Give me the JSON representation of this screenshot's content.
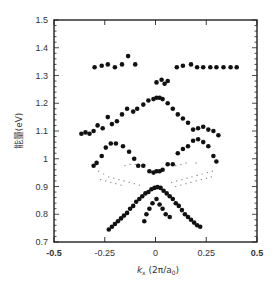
{
  "chart_data": {
    "type": "scatter",
    "title": "",
    "xlabel": "k_x (2π/a_0)",
    "xlabel_parts": {
      "main": "k",
      "sub": "x",
      "rest": " (2π/a",
      "sub2": "0",
      "end": ")"
    },
    "ylabel": "能量(eV)",
    "xlim": [
      -0.5,
      0.5
    ],
    "ylim": [
      0.7,
      1.5
    ],
    "xticks": [
      -0.5,
      -0.25,
      0,
      0.25,
      0.5
    ],
    "xtick_labels": [
      "-0.5",
      "-0.25",
      "0",
      "0.25",
      "0.5"
    ],
    "yticks": [
      0.7,
      0.8,
      0.9,
      1.0,
      1.1,
      1.2,
      1.3,
      1.4,
      1.5
    ],
    "ytick_labels": [
      "0.7",
      "0.8",
      "0.9",
      "1",
      "1.1",
      "1.2",
      "1.3",
      "1.4",
      "1.5"
    ],
    "grid": false,
    "legend": null,
    "series": [
      {
        "name": "upper-flat-band",
        "marker": "dot-large",
        "points": [
          [
            -0.3,
            1.33
          ],
          [
            -0.265,
            1.335
          ],
          [
            -0.235,
            1.34
          ],
          [
            -0.2,
            1.33
          ],
          [
            -0.165,
            1.34
          ],
          [
            -0.135,
            1.37
          ],
          [
            -0.1,
            1.34
          ],
          [
            0.105,
            1.33
          ],
          [
            0.135,
            1.335
          ],
          [
            0.175,
            1.34
          ],
          [
            0.205,
            1.33
          ],
          [
            0.235,
            1.33
          ],
          [
            0.27,
            1.33
          ],
          [
            0.3,
            1.33
          ],
          [
            0.335,
            1.33
          ],
          [
            0.37,
            1.33
          ],
          [
            0.4,
            1.33
          ]
        ]
      },
      {
        "name": "center-cluster-1.28",
        "marker": "dot-large",
        "points": [
          [
            0.005,
            1.275
          ],
          [
            0.03,
            1.285
          ],
          [
            0.045,
            1.27
          ],
          [
            0.06,
            1.28
          ]
        ]
      },
      {
        "name": "upper-A-band",
        "marker": "dot-large",
        "points": [
          [
            -0.365,
            1.09
          ],
          [
            -0.345,
            1.095
          ],
          [
            -0.325,
            1.09
          ],
          [
            -0.305,
            1.1
          ],
          [
            -0.285,
            1.12
          ],
          [
            -0.26,
            1.11
          ],
          [
            -0.235,
            1.15
          ],
          [
            -0.215,
            1.125
          ],
          [
            -0.19,
            1.135
          ],
          [
            -0.165,
            1.16
          ],
          [
            -0.14,
            1.18
          ],
          [
            -0.11,
            1.17
          ],
          [
            -0.09,
            1.18
          ],
          [
            -0.06,
            1.195
          ],
          [
            -0.035,
            1.21
          ],
          [
            -0.01,
            1.215
          ],
          [
            0.005,
            1.22
          ],
          [
            0.02,
            1.22
          ],
          [
            0.035,
            1.215
          ],
          [
            0.06,
            1.2
          ],
          [
            0.085,
            1.18
          ],
          [
            0.11,
            1.16
          ],
          [
            0.135,
            1.145
          ],
          [
            0.16,
            1.13
          ],
          [
            0.185,
            1.105
          ],
          [
            0.21,
            1.11
          ],
          [
            0.235,
            1.115
          ],
          [
            0.26,
            1.105
          ],
          [
            0.285,
            1.1
          ],
          [
            0.31,
            1.085
          ]
        ]
      },
      {
        "name": "middle-inverted-V",
        "marker": "dot-large",
        "points": [
          [
            -0.305,
            0.975
          ],
          [
            -0.29,
            0.985
          ],
          [
            -0.265,
            1.01
          ],
          [
            -0.245,
            1.04
          ],
          [
            -0.22,
            1.055
          ],
          [
            -0.195,
            1.055
          ],
          [
            -0.16,
            1.045
          ],
          [
            -0.13,
            1.025
          ],
          [
            -0.105,
            1.0
          ],
          [
            -0.085,
            0.975
          ],
          [
            -0.06,
            0.975
          ],
          [
            -0.03,
            0.955
          ],
          [
            -0.01,
            0.95
          ],
          [
            0.005,
            0.955
          ],
          [
            0.02,
            0.955
          ],
          [
            0.035,
            0.96
          ],
          [
            0.06,
            0.98
          ],
          [
            0.085,
            0.98
          ],
          [
            0.11,
            1.02
          ],
          [
            0.135,
            1.035
          ],
          [
            0.16,
            1.045
          ],
          [
            0.185,
            1.065
          ],
          [
            0.21,
            1.07
          ],
          [
            0.235,
            1.06
          ],
          [
            0.26,
            1.045
          ],
          [
            0.285,
            1.01
          ],
          [
            0.3,
            0.99
          ]
        ]
      },
      {
        "name": "faint-dotted-bands",
        "marker": "dot-small",
        "points": [
          [
            -0.28,
            0.955
          ],
          [
            -0.255,
            0.945
          ],
          [
            -0.23,
            0.935
          ],
          [
            -0.205,
            0.93
          ],
          [
            -0.18,
            0.925
          ],
          [
            -0.155,
            0.92
          ],
          [
            -0.13,
            0.915
          ],
          [
            -0.105,
            0.91
          ],
          [
            -0.08,
            0.905
          ],
          [
            -0.27,
            0.925
          ],
          [
            -0.245,
            0.92
          ],
          [
            -0.22,
            0.915
          ],
          [
            -0.195,
            0.91
          ],
          [
            -0.17,
            0.905
          ],
          [
            -0.15,
            0.975
          ],
          [
            -0.125,
            0.98
          ],
          [
            -0.1,
            0.98
          ],
          [
            0.1,
            0.975
          ],
          [
            0.125,
            0.98
          ],
          [
            0.15,
            0.985
          ],
          [
            0.2,
            0.985
          ],
          [
            0.08,
            0.915
          ],
          [
            0.105,
            0.92
          ],
          [
            0.13,
            0.925
          ],
          [
            0.155,
            0.93
          ],
          [
            0.18,
            0.935
          ],
          [
            0.205,
            0.94
          ],
          [
            0.23,
            0.945
          ],
          [
            0.255,
            0.95
          ],
          [
            0.28,
            0.955
          ],
          [
            0.1,
            0.9
          ],
          [
            0.125,
            0.905
          ],
          [
            0.15,
            0.91
          ],
          [
            0.175,
            0.915
          ],
          [
            0.2,
            0.92
          ],
          [
            0.225,
            0.925
          ],
          [
            0.25,
            0.93
          ],
          [
            0.275,
            0.935
          ]
        ]
      },
      {
        "name": "lower-inverted-V",
        "marker": "dot-large",
        "points": [
          [
            -0.23,
            0.745
          ],
          [
            -0.215,
            0.755
          ],
          [
            -0.2,
            0.765
          ],
          [
            -0.185,
            0.775
          ],
          [
            -0.17,
            0.785
          ],
          [
            -0.155,
            0.795
          ],
          [
            -0.14,
            0.805
          ],
          [
            -0.125,
            0.82
          ],
          [
            -0.11,
            0.83
          ],
          [
            -0.095,
            0.845
          ],
          [
            -0.08,
            0.855
          ],
          [
            -0.065,
            0.865
          ],
          [
            -0.05,
            0.875
          ],
          [
            -0.035,
            0.88
          ],
          [
            -0.02,
            0.89
          ],
          [
            -0.005,
            0.895
          ],
          [
            0.01,
            0.898
          ],
          [
            0.025,
            0.895
          ],
          [
            0.04,
            0.885
          ],
          [
            0.055,
            0.875
          ],
          [
            0.07,
            0.865
          ],
          [
            0.085,
            0.855
          ],
          [
            0.1,
            0.84
          ],
          [
            0.115,
            0.83
          ],
          [
            0.13,
            0.815
          ],
          [
            0.145,
            0.8
          ],
          [
            0.16,
            0.79
          ],
          [
            0.175,
            0.78
          ],
          [
            0.19,
            0.77
          ],
          [
            0.205,
            0.76
          ],
          [
            0.22,
            0.755
          ]
        ]
      },
      {
        "name": "inner-inverted-V",
        "marker": "dot-large",
        "points": [
          [
            -0.055,
            0.775
          ],
          [
            -0.045,
            0.8
          ],
          [
            -0.03,
            0.82
          ],
          [
            -0.015,
            0.84
          ],
          [
            0.005,
            0.855
          ],
          [
            0.02,
            0.835
          ],
          [
            0.035,
            0.82
          ],
          [
            0.05,
            0.8
          ],
          [
            0.07,
            0.79
          ]
        ]
      }
    ]
  }
}
